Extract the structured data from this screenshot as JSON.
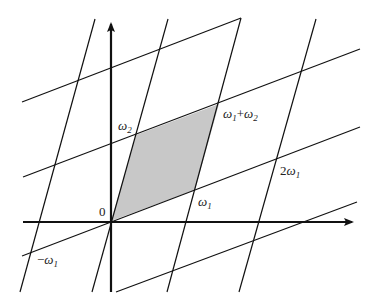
{
  "diagram": {
    "shade_color": "#c8c8c8",
    "line_color": "#111111",
    "labels": {
      "origin": "0",
      "omega1": "ω",
      "omega1_sub": "1",
      "omega2": "ω",
      "omega2_sub": "2",
      "sum_a": "ω",
      "sum_a_sub": "1",
      "sum_plus": "+",
      "sum_b": "ω",
      "sum_b_sub": "2",
      "two_omega1_coef": "2",
      "two_omega1": "ω",
      "two_omega1_sub": "1",
      "neg_omega1_sign": "−",
      "neg_omega1": "ω",
      "neg_omega1_sub": "1"
    },
    "points": {
      "origin": [
        111,
        221
      ],
      "omega1": [
        195,
        190
      ],
      "omega2": [
        136,
        135
      ],
      "omega1_plus_omega2": [
        219,
        104
      ],
      "two_omega1": [
        278,
        159
      ]
    }
  }
}
